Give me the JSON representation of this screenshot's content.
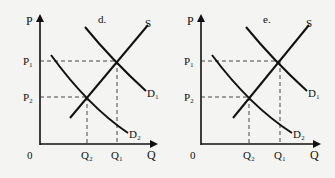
{
  "panels": [
    {
      "id": "d",
      "title": "d.",
      "axis": {
        "y_label": "P",
        "x_label": "Q",
        "origin": "0"
      },
      "prices": {
        "p1": "P₁",
        "p2": "P₂"
      },
      "quantities": {
        "q1": "Q₁",
        "q2": "Q₂"
      },
      "curves": {
        "supply": "S",
        "demand1": "D₁",
        "demand2": "D₂"
      }
    },
    {
      "id": "e",
      "title": "e.",
      "axis": {
        "y_label": "P",
        "x_label": "Q",
        "origin": "0"
      },
      "prices": {
        "p1": "P₁",
        "p2": "P₂"
      },
      "quantities": {
        "q1": "Q₁",
        "q2": "Q₂"
      },
      "curves": {
        "supply": "S",
        "demand1": "D₁",
        "demand2": "D₂"
      }
    }
  ]
}
